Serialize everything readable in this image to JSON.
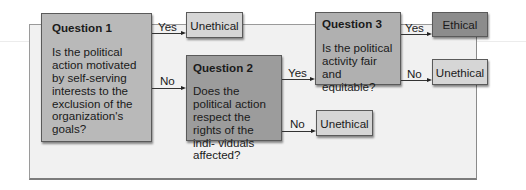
{
  "colors": {
    "panel": "#f1f1f1",
    "question1": "#b9b9b9",
    "question2": "#9c9c9c",
    "question3": "#b0b0b0",
    "unethical": "#d6d6d6",
    "ethical": "#8c8c8c"
  },
  "questions": [
    {
      "title": "Question 1",
      "text": "Is the political action motivated by self-serving interests to the exclusion of the organization's goals?"
    },
    {
      "title": "Question 2",
      "text": "Does the political action respect the rights of the indi- viduals affected?"
    },
    {
      "title": "Question 3",
      "text": "Is the political activity fair and equitable?"
    }
  ],
  "outcomes": {
    "q1_yes": "Unethical",
    "q2_no": "Unethical",
    "q3_yes": "Ethical",
    "q3_no": "Unethical"
  },
  "edges": {
    "q1_yes": "Yes",
    "q1_no": "No",
    "q2_yes": "Yes",
    "q2_no": "No",
    "q3_yes": "Yes",
    "q3_no": "No"
  }
}
